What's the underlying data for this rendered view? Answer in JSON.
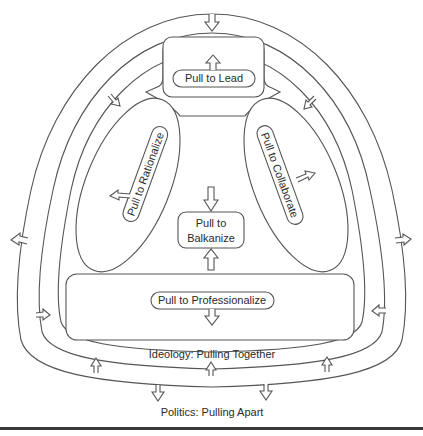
{
  "diagram": {
    "outer_band_label": "Politics: Pulling Apart",
    "inner_band_label": "Ideology: Pulling Together",
    "nodes": {
      "lead": "Pull to Lead",
      "rationalize": "Pull to Rationalize",
      "collaborate": "Pull to Collaborate",
      "balkanize_line1": "Pull to",
      "balkanize_line2": "Balkanize",
      "professionalize": "Pull to Professionalize"
    },
    "arrows": {
      "outer_band": [
        {
          "position": "top",
          "direction": "inward"
        },
        {
          "position": "left",
          "direction": "outward"
        },
        {
          "position": "right",
          "direction": "outward"
        },
        {
          "position": "bottom-left",
          "direction": "outward"
        },
        {
          "position": "bottom-right",
          "direction": "outward"
        }
      ],
      "inner_band": [
        {
          "position": "upper-left",
          "direction": "inward"
        },
        {
          "position": "upper-right",
          "direction": "inward"
        },
        {
          "position": "lower-left",
          "direction": "inward"
        },
        {
          "position": "lower-right",
          "direction": "inward"
        },
        {
          "position": "bottom-left",
          "direction": "inward"
        },
        {
          "position": "bottom-center",
          "direction": "inward"
        },
        {
          "position": "bottom-right",
          "direction": "inward"
        }
      ],
      "balkanize": [
        "from-top",
        "from-bottom"
      ],
      "lead": "up",
      "rationalize": "outward-left",
      "collaborate": "outward-right",
      "professionalize": "down"
    },
    "colors": {
      "stroke": "#555555",
      "text": "#2a2a2a",
      "background": "#ffffff",
      "rule": "#3a3a3a"
    }
  }
}
